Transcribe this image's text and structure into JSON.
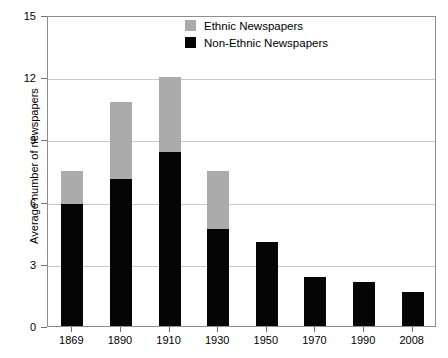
{
  "chart_data": {
    "type": "bar",
    "stacked": true,
    "title": "",
    "subtitle": "",
    "xlabel": "",
    "ylabel": "Average number of newspapers",
    "categories": [
      "1869",
      "1890",
      "1910",
      "1930",
      "1950",
      "1970",
      "1990",
      "2008"
    ],
    "series": [
      {
        "name": "Non-Ethnic Newspapers",
        "color": "#050505",
        "values": [
          5.9,
          7.1,
          8.4,
          4.7,
          4.05,
          2.35,
          2.1,
          1.65
        ]
      },
      {
        "name": "Ethnic Newspapers",
        "color": "#ababab",
        "values": [
          1.6,
          3.7,
          3.6,
          2.8,
          0.0,
          0.0,
          0.0,
          0.0
        ]
      }
    ],
    "totals": [
      7.5,
      10.8,
      12.0,
      7.5,
      4.05,
      2.35,
      2.1,
      1.65
    ],
    "ylim": [
      0,
      15
    ],
    "yticks": [
      "0",
      "3",
      "6",
      "9",
      "12",
      "15"
    ],
    "ytick_values": [
      0,
      3,
      6,
      9,
      12,
      15
    ],
    "grid": true,
    "legend_position": "top-center"
  },
  "legend": {
    "entries": [
      {
        "label": "Ethnic Newspapers",
        "color": "#ababab"
      },
      {
        "label": "Non-Ethnic Newspapers",
        "color": "#050505"
      }
    ]
  }
}
